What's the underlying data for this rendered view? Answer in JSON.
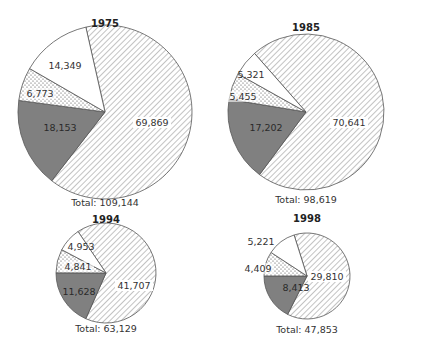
{
  "chart_data": {
    "type": "pie",
    "title": "",
    "series_order": [
      "hatched",
      "dark",
      "dotted",
      "white"
    ],
    "fills": {
      "hatched": "#ffffff",
      "hatch_line": "#9a9a9a",
      "dark": "#808080",
      "dotted": "#ffffff",
      "dot": "#444444",
      "white": "#ffffff",
      "stroke": "#555555"
    },
    "charts": [
      {
        "title": "1975",
        "total_label": "Total: 109,144",
        "total": 109144,
        "values": [
          69869,
          18153,
          6773,
          14349
        ],
        "labels": [
          "69,869",
          "18,153",
          "6,773",
          "14,349"
        ],
        "cx": 105,
        "cy": 112,
        "r": 87,
        "start_angle": -12.7,
        "title_y": 27,
        "total_y": 206,
        "label_pos": [
          [
            152,
            126
          ],
          [
            60,
            131
          ],
          [
            40,
            97
          ],
          [
            65,
            69
          ]
        ]
      },
      {
        "title": "1985",
        "total_label": "Total: 98,619",
        "total": 98619,
        "values": [
          70641,
          17202,
          5455,
          5321
        ],
        "labels": [
          "70,641",
          "17,202",
          "5,455",
          "5,321"
        ],
        "cx": 306,
        "cy": 112,
        "r": 78,
        "start_angle": -41.3,
        "title_y": 31,
        "total_y": 203,
        "label_pos": [
          [
            349,
            126
          ],
          [
            266,
            131
          ],
          [
            243,
            100
          ],
          [
            251,
            78
          ]
        ]
      },
      {
        "title": "1994",
        "total_label": "Total: 63,129",
        "total": 63129,
        "values": [
          41707,
          11628,
          4841,
          4953
        ],
        "labels": [
          "41,707",
          "11,628",
          "4,841",
          "4,953"
        ],
        "cx": 106,
        "cy": 273,
        "r": 50,
        "start_angle": -34,
        "title_y": 223,
        "total_y": 332,
        "label_pos": [
          [
            134,
            289
          ],
          [
            79,
            295
          ],
          [
            78,
            270
          ],
          [
            81,
            250
          ]
        ]
      },
      {
        "title": "1998",
        "total_label": "Total: 47,853",
        "total": 47853,
        "values": [
          29810,
          8413,
          4409,
          5221
        ],
        "labels": [
          "29,810",
          "8,413",
          "4,409",
          "5,221"
        ],
        "cx": 307,
        "cy": 276,
        "r": 43,
        "start_angle": -17.5,
        "title_y": 222,
        "total_y": 333,
        "label_pos": [
          [
            327,
            280
          ],
          [
            296,
            291
          ],
          [
            258,
            272
          ],
          [
            261,
            245
          ]
        ]
      }
    ],
    "legend": []
  }
}
